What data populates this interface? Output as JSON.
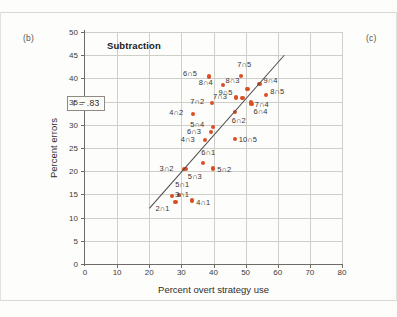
{
  "figure": {
    "panel_tag_left": "(b)",
    "panel_tag_right": "(c)",
    "title": "Subtraction",
    "annotation": "r = .83"
  },
  "colors": {
    "point": "#d94f24",
    "line": "#4b4846",
    "grid": "#cfcfc9",
    "axis": "#6e6b66",
    "page": "#fdfdfb"
  },
  "chart_data": {
    "type": "scatter",
    "title": "Subtraction",
    "xlabel": "Percent overt strategy use",
    "ylabel": "Percent errors",
    "xlim": [
      0,
      80
    ],
    "ylim": [
      0,
      50
    ],
    "xticks": [
      0,
      10,
      20,
      30,
      40,
      50,
      60,
      70,
      80
    ],
    "yticks": [
      0,
      5,
      10,
      15,
      20,
      25,
      30,
      35,
      40,
      45,
      50
    ],
    "grid": true,
    "legend": null,
    "annotations": [
      {
        "text": "r = .83",
        "kind": "correlation-box"
      }
    ],
    "trendline": {
      "kind": "regression",
      "x0": 20.0,
      "y0": 12.0,
      "x1": 62.0,
      "y1": 45.0
    },
    "points": [
      {
        "label": "6∩5",
        "x": 38.6,
        "y": 40.4,
        "lx": -26,
        "ly": -4
      },
      {
        "label": "7∩5",
        "x": 48.6,
        "y": 40.6,
        "lx": -4,
        "ly": -12
      },
      {
        "label": "8∩4",
        "x": 42.9,
        "y": 38.5,
        "lx": -24,
        "ly": -3
      },
      {
        "label": "8∩3",
        "x": 50.6,
        "y": 37.7,
        "lx": -22,
        "ly": -9
      },
      {
        "label": "9∩4",
        "x": 54.3,
        "y": 38.8,
        "lx": 4,
        "ly": -4
      },
      {
        "label": "9∩5",
        "x": 49.0,
        "y": 35.8,
        "lx": -24,
        "ly": -6
      },
      {
        "label": "8∩5",
        "x": 56.4,
        "y": 36.5,
        "lx": 4,
        "ly": -4
      },
      {
        "label": "7∩4",
        "x": 51.6,
        "y": 34.8,
        "lx": 4,
        "ly": 1
      },
      {
        "label": "7∩3",
        "x": 47.0,
        "y": 35.9,
        "lx": -23,
        "ly": -1
      },
      {
        "label": "7∩2",
        "x": 39.6,
        "y": 34.7,
        "lx": -22,
        "ly": -2
      },
      {
        "label": "6∩4",
        "x": 51.8,
        "y": 34.5,
        "lx": 2,
        "ly": 7
      },
      {
        "label": "6∩2",
        "x": 46.6,
        "y": 32.7,
        "lx": -3,
        "ly": 8
      },
      {
        "label": "4∩2",
        "x": 33.7,
        "y": 32.4,
        "lx": -24,
        "ly": -2
      },
      {
        "label": "5∩4",
        "x": 39.9,
        "y": 29.6,
        "lx": -23,
        "ly": -3
      },
      {
        "label": "6∩3",
        "x": 39.2,
        "y": 28.4,
        "lx": -24,
        "ly": -1
      },
      {
        "label": "4∩3",
        "x": 37.3,
        "y": 26.7,
        "lx": -24,
        "ly": -1
      },
      {
        "label": "10∩5",
        "x": 46.6,
        "y": 26.9,
        "lx": 4,
        "ly": 0
      },
      {
        "label": "6∩1",
        "x": 36.8,
        "y": 21.7,
        "lx": -2,
        "ly": -11
      },
      {
        "label": "3∩2",
        "x": 30.7,
        "y": 20.5,
        "lx": -24,
        "ly": -1
      },
      {
        "label": "5∩3",
        "x": 31.4,
        "y": 20.4,
        "lx": 2,
        "ly": 7
      },
      {
        "label": "5∩2",
        "x": 39.9,
        "y": 20.6,
        "lx": 4,
        "ly": 1
      },
      {
        "label": "5∩1",
        "x": 29.3,
        "y": 14.9,
        "lx": -4,
        "ly": -11
      },
      {
        "label": "3∩1",
        "x": 27.1,
        "y": 14.7,
        "lx": 3,
        "ly": -2
      },
      {
        "label": "2∩1",
        "x": 28.2,
        "y": 13.3,
        "lx": -20,
        "ly": 6
      },
      {
        "label": "4∩1",
        "x": 33.4,
        "y": 13.7,
        "lx": 4,
        "ly": 2
      }
    ]
  }
}
